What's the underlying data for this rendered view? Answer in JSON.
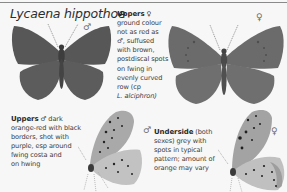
{
  "page": {
    "title": "Lycaena hippothoe"
  },
  "figures": [
    {
      "id": "male-upperside",
      "sex_symbol": "♂",
      "view": "upperside"
    },
    {
      "id": "female-upperside",
      "sex_symbol": "♀",
      "view": "upperside"
    },
    {
      "id": "male-underside",
      "sex_symbol": "♂",
      "view": "underside"
    },
    {
      "id": "female-underside",
      "sex_symbol": "♀",
      "view": "underside"
    }
  ],
  "captions": {
    "female_upperside": {
      "heading": "Uppers",
      "symbol": "♀",
      "lines": [
        "ground colour",
        "not as red as",
        "♂, suffused",
        "with brown,",
        "postdiscal spots",
        "on fwing in",
        "evenly curved",
        "row (cp",
        "L. alciphron)"
      ]
    },
    "male_upperside": {
      "heading": "Uppers",
      "symbol": "♂",
      "first_line_rest": "dark",
      "lines": [
        "orange-red with black",
        "borders, shot with",
        "purple, esp around",
        "fwing costa and",
        "on hwing"
      ]
    },
    "underside": {
      "heading": "Underside",
      "first_line_rest": "(both",
      "lines": [
        "sexes) grey with",
        "spots in typical",
        "pattern; amount of",
        "orange may vary"
      ]
    }
  },
  "colors": {
    "background": "#f7f7f7",
    "wing_dark": "#555555",
    "wing_female": "#6b6b6b",
    "underside_fore": "#a8a8a8",
    "underside_hind": "#c4c4c4",
    "text": "#3c3c3c"
  }
}
